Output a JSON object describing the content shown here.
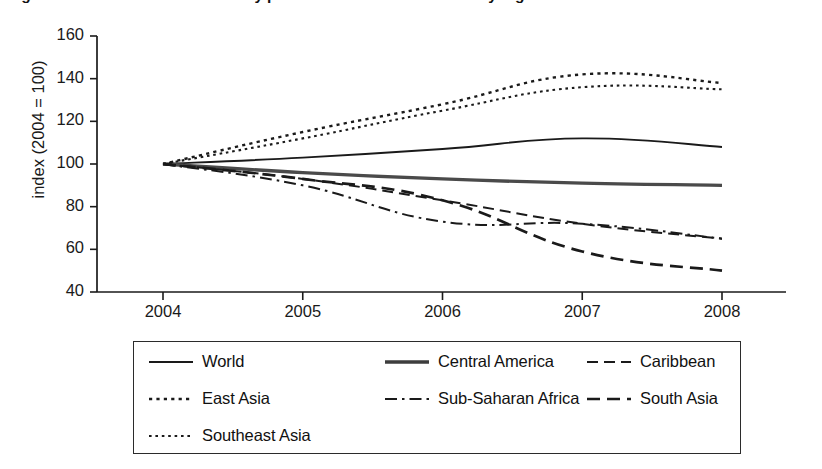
{
  "figure": {
    "title": "Figure 2.3   Index of food commodity prices in US constant dollars by region",
    "title_clipped": true
  },
  "axes": {
    "y_label": "index (2004 = 100)",
    "y_ticks": [
      "40",
      "60",
      "80",
      "100",
      "120",
      "140",
      "160"
    ],
    "x_ticks": [
      "2004",
      "2005",
      "2006",
      "2007",
      "2008"
    ]
  },
  "legend": {
    "rows": [
      [
        {
          "label": "World",
          "style": "solid",
          "width": 1.9,
          "color": "#1a1a1a"
        },
        {
          "label": "Central America",
          "style": "solid-thick",
          "width": 3.4,
          "color": "#3d3d3d"
        },
        {
          "label": "Caribbean",
          "style": "dashed",
          "width": 1.9,
          "color": "#1a1a1a"
        }
      ],
      [
        {
          "label": "East Asia",
          "style": "dotted",
          "width": 2.2,
          "color": "#1a1a1a"
        },
        {
          "label": "Sub-Saharan Africa",
          "style": "dashdot",
          "width": 1.9,
          "color": "#1a1a1a"
        },
        {
          "label": "South Asia",
          "style": "dashed-wide",
          "width": 2.6,
          "color": "#1a1a1a"
        }
      ],
      [
        {
          "label": "Southeast Asia",
          "style": "dotted-fine",
          "width": 2.0,
          "color": "#1a1a1a"
        }
      ]
    ]
  },
  "chart_data": {
    "type": "line",
    "title": "Figure 2.3   Index of food commodity prices in US constant dollars by region",
    "xlabel": "",
    "ylabel": "index (2004 = 100)",
    "x": [
      2004,
      2005,
      2006,
      2007,
      2008
    ],
    "xlim": [
      2004,
      2008
    ],
    "ylim": [
      40,
      160
    ],
    "ytick_step": 20,
    "grid": false,
    "legend_position": "below-plot",
    "series": [
      {
        "name": "World",
        "style": "solid",
        "values": [
          100,
          103,
          107,
          112,
          108
        ]
      },
      {
        "name": "Central America",
        "style": "solid-thick",
        "values": [
          100,
          96,
          93,
          91,
          90
        ]
      },
      {
        "name": "Caribbean",
        "style": "dashed",
        "values": [
          100,
          93,
          83,
          72,
          65
        ]
      },
      {
        "name": "East Asia",
        "style": "dotted",
        "values": [
          100,
          115,
          128,
          142,
          138
        ]
      },
      {
        "name": "Sub-Saharan Africa",
        "style": "dashdot",
        "values": [
          100,
          90,
          73,
          72,
          65
        ]
      },
      {
        "name": "South Asia",
        "style": "dashed-wide",
        "values": [
          100,
          93,
          83,
          59,
          50
        ]
      },
      {
        "name": "Southeast Asia",
        "style": "dotted-fine",
        "values": [
          100,
          112,
          125,
          136,
          135
        ]
      }
    ]
  }
}
